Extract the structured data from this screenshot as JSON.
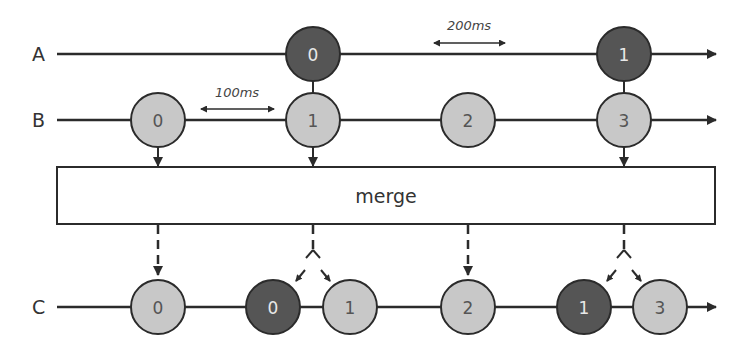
{
  "colors": {
    "line": "#2b2b2b",
    "light_marble": "#c8c8c8",
    "dark_marble": "#555555",
    "box_fill": "#ffffff",
    "box_stroke": "#2b2b2b"
  },
  "streams": {
    "A": {
      "label": "A",
      "marbles": [
        "0",
        "1"
      ]
    },
    "B": {
      "label": "B",
      "marbles": [
        "0",
        "1",
        "2",
        "3"
      ]
    },
    "C": {
      "label": "C",
      "marbles": [
        "0",
        "0",
        "1",
        "2",
        "1",
        "3"
      ]
    }
  },
  "annotations": {
    "interval_b": "100ms",
    "interval_a": "200ms"
  },
  "operator": {
    "label": "merge"
  }
}
